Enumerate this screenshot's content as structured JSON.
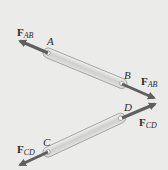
{
  "diagram": {
    "type": "two-force members",
    "background": "#ebebea",
    "colors": {
      "member_fill": "#d6d6d4",
      "member_edge": "#9a9a98",
      "arrow": "#6a6a6a",
      "text": "#2a2a2a"
    },
    "members": [
      {
        "name": "AB",
        "ends": [
          "A",
          "B"
        ]
      },
      {
        "name": "CD",
        "ends": [
          "C",
          "D"
        ]
      }
    ],
    "points": {
      "A": "A",
      "B": "B",
      "C": "C",
      "D": "D"
    },
    "forces": {
      "fab_at_a": {
        "main": "F",
        "sub": "AB"
      },
      "fab_at_b": {
        "main": "F",
        "sub": "AB"
      },
      "fcd_at_c": {
        "main": "F",
        "sub": "CD"
      },
      "fcd_at_d": {
        "main": "F",
        "sub": "CD"
      }
    }
  }
}
